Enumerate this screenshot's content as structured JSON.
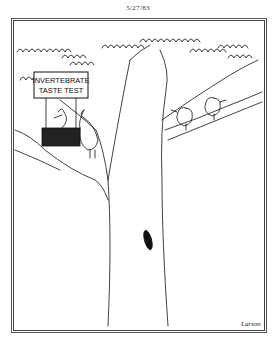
{
  "cartoon": {
    "date": "5/27/83",
    "sign": {
      "line1": "INVERTEBRATE",
      "line2": "TASTE TEST"
    },
    "signature": "Larson",
    "scene": "Bird running an invertebrate taste test booth on a tree branch; two birds perched on another branch",
    "colors": {
      "ink": "#111111",
      "paper": "#ffffff",
      "frame": "#444444"
    }
  }
}
